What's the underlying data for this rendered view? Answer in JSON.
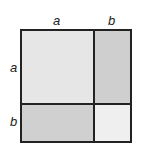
{
  "diagram": {
    "labels": {
      "top_a": "a",
      "top_b": "b",
      "left_a": "a",
      "left_b": "b"
    },
    "regions": [
      {
        "name": "a-squared",
        "color": "#e6e6e6"
      },
      {
        "name": "ab-top-right",
        "color": "#cfcfcf"
      },
      {
        "name": "ab-bottom-left",
        "color": "#d0d0d0"
      },
      {
        "name": "b-squared",
        "color": "#efefef"
      }
    ]
  }
}
